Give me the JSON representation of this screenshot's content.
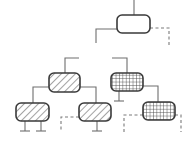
{
  "diagram": {
    "type": "binary-tree",
    "colors": {
      "stroke": "#3a3a3a",
      "edge": "#6e6e6e",
      "null_edge": "#7a7a7a",
      "background": "#ffffff",
      "pattern_ink": "#555555"
    },
    "nodes": [
      {
        "id": "root",
        "fill": "empty",
        "parent": null,
        "terminals": 0
      },
      {
        "id": "left",
        "fill": "diagonal-hatch",
        "parent": "root",
        "terminals": 0
      },
      {
        "id": "right",
        "fill": "grid-hatch",
        "parent": "root",
        "terminals": 1
      },
      {
        "id": "left-left",
        "fill": "diagonal-hatch",
        "parent": "left",
        "terminals": 2
      },
      {
        "id": "left-right",
        "fill": "diagonal-hatch",
        "parent": "left",
        "terminals": 1
      },
      {
        "id": "right-right",
        "fill": "grid-hatch",
        "parent": "right",
        "terminals": 0
      }
    ],
    "edges": [
      {
        "from": "root",
        "to": "left",
        "style": "solid"
      },
      {
        "from": "root",
        "to": "right",
        "style": "solid"
      },
      {
        "from": "left",
        "to": "left-left",
        "style": "solid"
      },
      {
        "from": "left",
        "to": "left-right",
        "style": "solid"
      },
      {
        "from": "right",
        "to": "right-right",
        "style": "solid"
      }
    ],
    "null_links": [
      {
        "node": "root",
        "side": "right",
        "style": "dashed"
      },
      {
        "node": "left-right",
        "side": "left",
        "style": "dashed"
      },
      {
        "node": "right-right",
        "side": "left",
        "style": "dashed"
      },
      {
        "node": "right-right",
        "side": "right",
        "style": "dashed"
      }
    ]
  }
}
